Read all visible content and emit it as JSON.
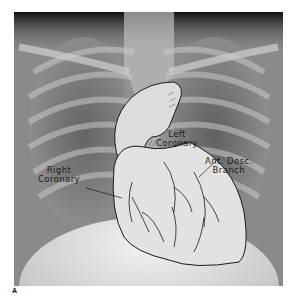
{
  "figure": {
    "panel_letter": "A",
    "labels": {
      "left_coronary": [
        "Left",
        "Coronary"
      ],
      "right_coronary": [
        "Right",
        "Coronary"
      ],
      "ant_desc_branch": [
        "Ant. Desc.",
        "Branch"
      ]
    },
    "colors": {
      "background": "#ffffff",
      "xray_dark": "#1e1e1e",
      "xray_mid": "#8a8a8a",
      "xray_light": "#d8d8d8",
      "heart_fill": "#e6e6e6",
      "ink": "#1a1a1a"
    }
  }
}
